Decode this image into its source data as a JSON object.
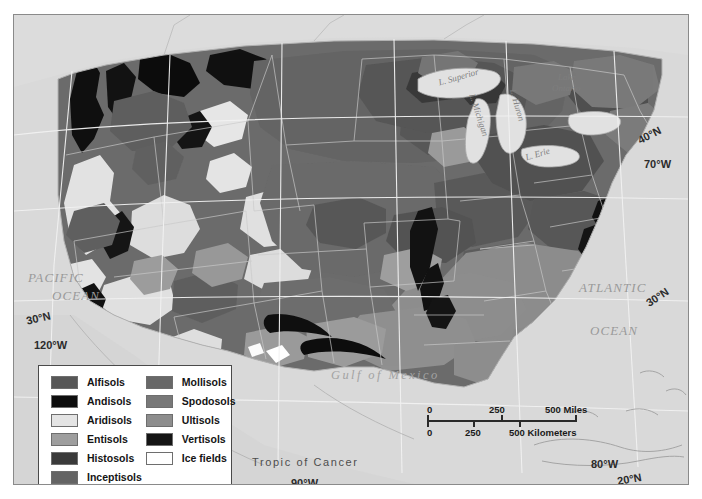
{
  "map": {
    "title": "Soil Orders of the United States",
    "background_color": "#d9d9d9",
    "land_base_color": "#9a9a9a",
    "ocean_color": "#d9d9d9",
    "frame_color": "#8a8a8a",
    "ocean_labels": [
      {
        "name": "pacific-ocean",
        "line1": "PACIFIC",
        "line2": "OCEAN"
      },
      {
        "name": "atlantic-ocean",
        "line1": "ATLANTIC",
        "line2": "OCEAN"
      }
    ],
    "gulf_label": "Gulf  of  Mexico",
    "tropic_label": "Tropic  of  Cancer",
    "lake_labels": [
      {
        "name": "lake-superior",
        "text": "L. Superior"
      },
      {
        "name": "lake-michigan",
        "text": "L. Michigan"
      },
      {
        "name": "lake-huron",
        "text": "L. Huron"
      },
      {
        "name": "lake-erie",
        "text": "L. Erie"
      },
      {
        "name": "lake-ontario-line1",
        "text": "Lake"
      },
      {
        "name": "lake-ontario-line2",
        "text": "Ontario"
      }
    ],
    "coordinates": [
      {
        "name": "lat-40n",
        "text": "40°N"
      },
      {
        "name": "lon-70w",
        "text": "70°W"
      },
      {
        "name": "lat-30n-east",
        "text": "30°N"
      },
      {
        "name": "lat-30n-west",
        "text": "30°N"
      },
      {
        "name": "lon-120w",
        "text": "120°W"
      },
      {
        "name": "lon-90w",
        "text": "90°W"
      },
      {
        "name": "lon-80w",
        "text": "80°W"
      },
      {
        "name": "lat-20n",
        "text": "20°N"
      }
    ]
  },
  "legend": {
    "column1": [
      {
        "label": "Alfisols",
        "color": "#575757"
      },
      {
        "label": "Andisols",
        "color": "#0d0d0d"
      },
      {
        "label": "Aridisols",
        "color": "#e4e4e4"
      },
      {
        "label": "Entisols",
        "color": "#9e9e9e"
      },
      {
        "label": "Histosols",
        "color": "#3a3a3a"
      },
      {
        "label": "Inceptisols",
        "color": "#646464"
      }
    ],
    "column2": [
      {
        "label": "Mollisols",
        "color": "#686868"
      },
      {
        "label": "Spodosols",
        "color": "#787878"
      },
      {
        "label": "Ultisols",
        "color": "#8d8d8d"
      },
      {
        "label": "Vertisols",
        "color": "#151515"
      },
      {
        "label": "Ice fields",
        "color": "#ffffff"
      }
    ]
  },
  "scale_bar": {
    "miles": {
      "ticks": [
        "0",
        "250",
        "500 Miles"
      ],
      "values": [
        0,
        250,
        500
      ],
      "unit": "Miles"
    },
    "kilometers": {
      "ticks": [
        "0",
        "250",
        "500 Kilometers"
      ],
      "values": [
        0,
        250,
        500
      ],
      "unit": "Kilometers"
    }
  }
}
